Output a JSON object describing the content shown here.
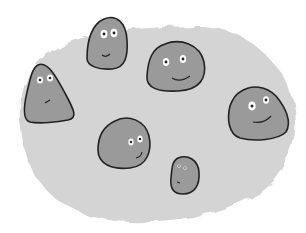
{
  "scene": {
    "description": "Six gray blob characters with faces on a mottled gray patch",
    "background_color": "#ffffff",
    "patch_color": "#d2d2d2",
    "blob_fill": "#9a9a9a",
    "outline_color": "#222222"
  },
  "blobs": [
    {
      "name": "top-center-blob",
      "expression": "smile"
    },
    {
      "name": "left-blob",
      "expression": "frown"
    },
    {
      "name": "upper-right-blob",
      "expression": "smile"
    },
    {
      "name": "right-blob",
      "expression": "smile"
    },
    {
      "name": "center-blob",
      "expression": "smirk"
    },
    {
      "name": "small-blob",
      "expression": "neutral"
    }
  ]
}
